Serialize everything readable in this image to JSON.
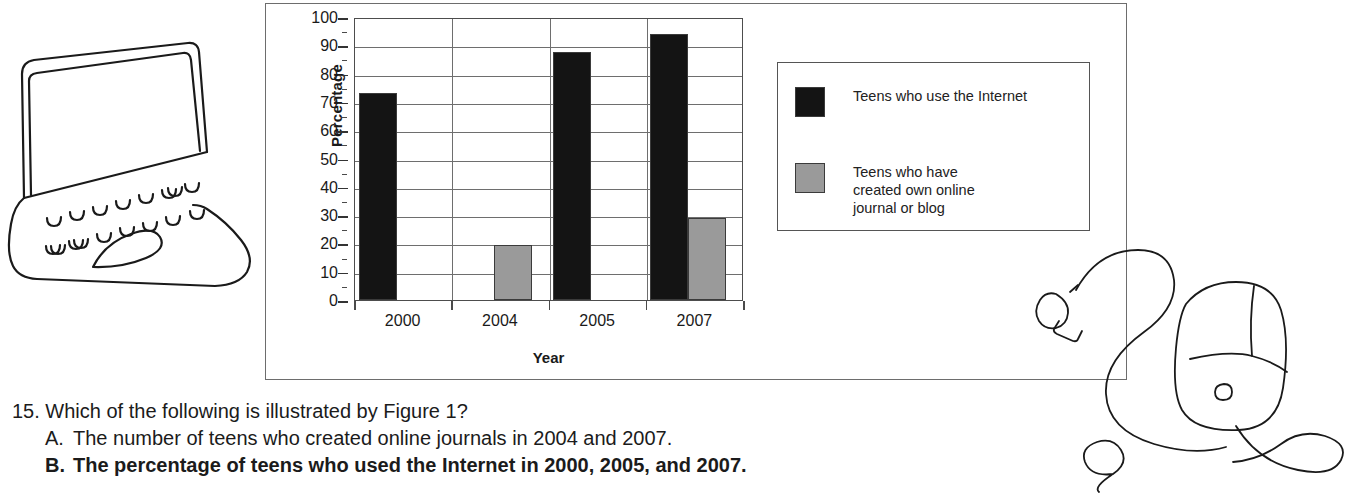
{
  "figure": {
    "panel_name": "Figure 1",
    "colors": {
      "series_internet": "#141414",
      "series_blog": "#9a9a9a",
      "grid": "#6e6e6e",
      "axis": "#4a4a4a",
      "border": "#6d6d6d"
    }
  },
  "chart_data": {
    "type": "bar",
    "title": "",
    "xlabel": "Year",
    "ylabel": "Percentage",
    "categories": [
      "2000",
      "2004",
      "2005",
      "2007"
    ],
    "ylim": [
      0,
      100
    ],
    "ytick_step": 10,
    "yminor_step": 5,
    "ytick_labels": [
      "100",
      "90",
      "80",
      "70",
      "60",
      "50",
      "40",
      "30",
      "20",
      "10",
      "0"
    ],
    "grid": "horizontal-and-vertical",
    "legend_position": "right-outside",
    "series": [
      {
        "name": "Teens who use the Internet",
        "color": "#141414",
        "values": [
          73,
          null,
          87.5,
          94
        ]
      },
      {
        "name": "Teens who have created own online journal or blog",
        "color": "#9a9a9a",
        "values": [
          null,
          19.5,
          null,
          29
        ]
      }
    ]
  },
  "legend": {
    "items": [
      {
        "swatch": "#141414",
        "label": "Teens who use the Internet"
      },
      {
        "swatch": "#9a9a9a",
        "label": "Teens who have\ncreated own online\njournal or blog"
      }
    ]
  },
  "question": {
    "number": "15.",
    "stem": "Which of the following is illustrated by Figure 1?",
    "choices": [
      {
        "letter": "A.",
        "text": "The number of teens who created online journals in 2004 and 2007.",
        "bold": false
      },
      {
        "letter": "B.",
        "text": "The percentage of teens who used the Internet in 2000, 2005, and 2007.",
        "bold": true
      }
    ]
  },
  "illustrations": {
    "laptop": "laptop-doodle",
    "mouse": "computer-mouse-doodle"
  }
}
